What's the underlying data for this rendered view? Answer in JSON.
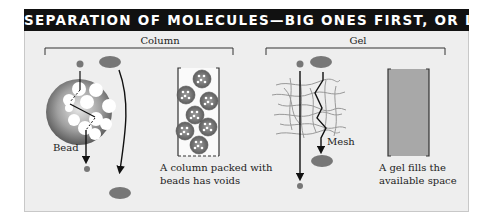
{
  "title": "SEPARATION OF MOLECULES—BIG ONES FIRST, OR LAST",
  "sections": [
    {
      "label": "Column",
      "captions": {
        "bead": "Bead",
        "column_line1": "A column packed with",
        "column_line2": "beads has voids"
      }
    },
    {
      "label": "Gel",
      "captions": {
        "mesh": "Mesh",
        "gel_line1": "A gel fills the",
        "gel_line2": "available space"
      }
    }
  ],
  "colors": {
    "header_bg": "#111111",
    "panel_bg": "#eeeeee",
    "molecule": "#777777",
    "gel_fill": "#a8a8a8",
    "line": "#111111"
  }
}
